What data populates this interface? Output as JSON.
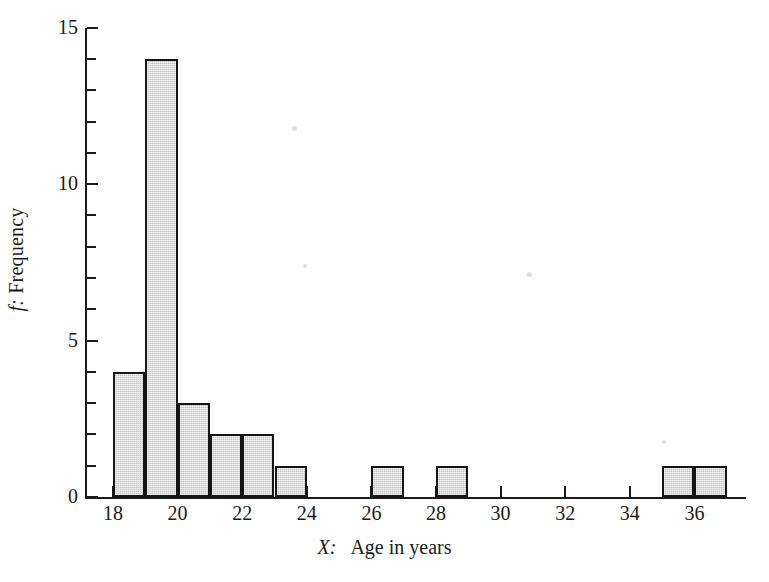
{
  "figure": {
    "background_color": "#ffffff",
    "ink_color": "#1a1a1a",
    "bar_fill_color": "#c3c3c3",
    "bar_edge_color": "#151515"
  },
  "axes": {
    "y": {
      "label_prefix": "f:",
      "label_text": "Frequency",
      "tick_labels": [
        "0",
        "5",
        "10",
        "15"
      ],
      "tick_values": [
        0,
        5,
        10,
        15
      ],
      "minor_tick_values": [
        1,
        2,
        3,
        4,
        6,
        7,
        8,
        9,
        11,
        12,
        13,
        14
      ],
      "range": [
        0,
        15
      ]
    },
    "x": {
      "label_prefix": "X:",
      "label_text": "Age in years",
      "tick_labels": [
        "18",
        "20",
        "22",
        "24",
        "26",
        "28",
        "30",
        "32",
        "34",
        "36"
      ],
      "tick_values": [
        18,
        20,
        22,
        24,
        26,
        28,
        30,
        32,
        34,
        36
      ],
      "range": [
        17,
        38
      ]
    }
  },
  "chart_data": {
    "type": "bar",
    "title": "",
    "xlabel": "X:  Age in years",
    "ylabel": "f: Frequency",
    "xlim": [
      17,
      38
    ],
    "ylim": [
      0,
      15
    ],
    "grid": false,
    "legend": null,
    "bin_width": 1,
    "bin_starts": [
      18,
      19,
      20,
      21,
      22,
      23,
      26,
      28,
      35,
      36
    ],
    "bin_ranges": [
      "18-19",
      "19-20",
      "20-21",
      "21-22",
      "22-23",
      "23-24",
      "26-27",
      "28-29",
      "35-36",
      "36-37"
    ],
    "categories": [
      "18",
      "19",
      "20",
      "21",
      "22",
      "23",
      "26",
      "28",
      "35",
      "36"
    ],
    "values": [
      4,
      14,
      3,
      2,
      2,
      1,
      1,
      1,
      1,
      1
    ],
    "total_frequency": 30
  }
}
